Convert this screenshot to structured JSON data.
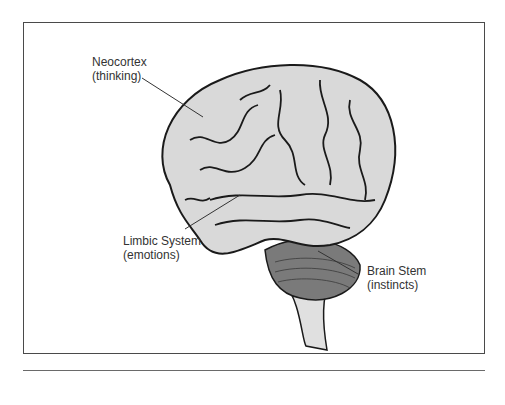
{
  "diagram": {
    "labels": [
      {
        "id": "neocortex",
        "title": "Neocortex",
        "subtitle": "(thinking)"
      },
      {
        "id": "limbic",
        "title": "Limbic System",
        "subtitle": "(emotions)"
      },
      {
        "id": "brainstem",
        "title": "Brain Stem",
        "subtitle": "(instincts)"
      }
    ],
    "colors": {
      "brain_fill": "#d9d9d9",
      "outline": "#1a1a1a",
      "leader": "#333333",
      "cerebellum": "#6e6e6e"
    }
  }
}
